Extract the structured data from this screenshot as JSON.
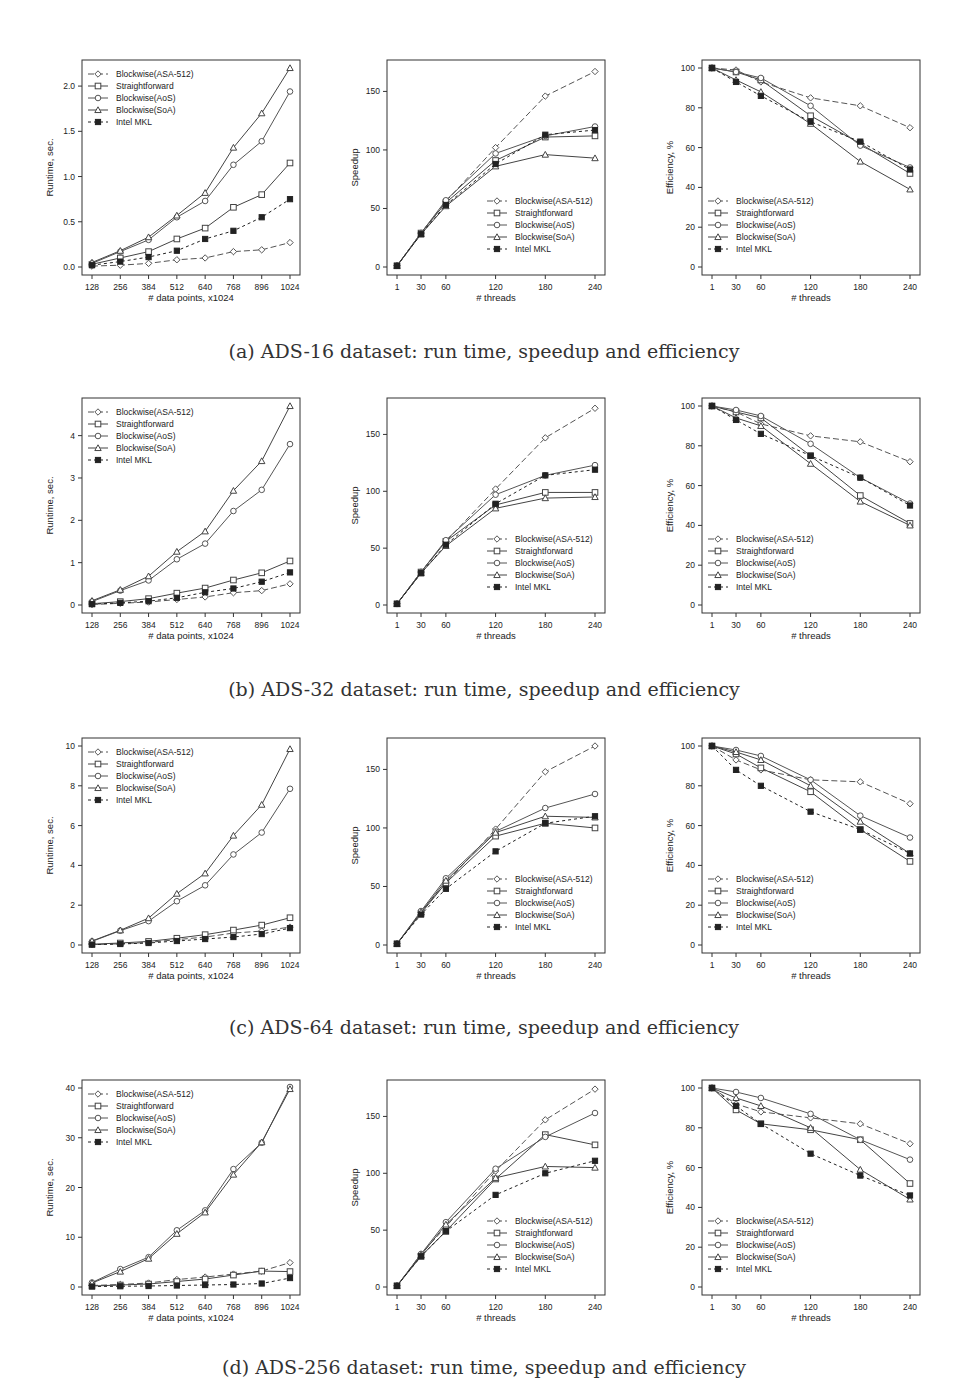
{
  "legend_labels": [
    "Blockwise(ASA-512)",
    "Straightforward",
    "Blockwise(AoS)",
    "Blockwise(SoA)",
    "Intel MKL"
  ],
  "series_style": [
    {
      "name": "Blockwise(ASA-512)",
      "marker": "diamond",
      "dash": "6,3"
    },
    {
      "name": "Straightforward",
      "marker": "square",
      "dash": ""
    },
    {
      "name": "Blockwise(AoS)",
      "marker": "circle",
      "dash": ""
    },
    {
      "name": "Blockwise(SoA)",
      "marker": "triangle",
      "dash": ""
    },
    {
      "name": "Intel MKL",
      "marker": "filled-square",
      "dash": "3,3"
    }
  ],
  "captions": [
    "(a) ADS-16 dataset: run time, speedup and efficiency",
    "(b) ADS-32 dataset: run time, speedup and efficiency",
    "(c) ADS-64 dataset: run time, speedup and efficiency",
    "(d) ADS-256 dataset: run time, speedup and efficiency"
  ],
  "chart_data": [
    {
      "id": "a-runtime",
      "type": "line",
      "title": "",
      "xlabel": "# data points, x1024",
      "ylabel": "Runtime, sec.",
      "x": [
        128,
        256,
        384,
        512,
        640,
        768,
        896,
        1024
      ],
      "ylim": [
        0,
        2.2
      ],
      "yticks": [
        0.0,
        0.5,
        1.0,
        1.5,
        2.0
      ],
      "ytick_labels": [
        "0.0",
        "0.5",
        "1.0",
        "1.5",
        "2.0"
      ],
      "legend": "topleft",
      "series": [
        {
          "name": "Blockwise(ASA-512)",
          "values": [
            0.01,
            0.02,
            0.04,
            0.08,
            0.1,
            0.17,
            0.19,
            0.27
          ]
        },
        {
          "name": "Straightforward",
          "values": [
            0.03,
            0.1,
            0.17,
            0.31,
            0.43,
            0.66,
            0.8,
            1.15
          ]
        },
        {
          "name": "Blockwise(AoS)",
          "values": [
            0.04,
            0.17,
            0.3,
            0.55,
            0.73,
            1.13,
            1.39,
            1.94
          ]
        },
        {
          "name": "Blockwise(SoA)",
          "values": [
            0.05,
            0.18,
            0.33,
            0.57,
            0.82,
            1.32,
            1.7,
            2.2
          ]
        },
        {
          "name": "Intel MKL",
          "values": [
            0.02,
            0.06,
            0.11,
            0.18,
            0.31,
            0.4,
            0.55,
            0.75
          ]
        }
      ]
    },
    {
      "id": "a-speedup",
      "type": "line",
      "xlabel": "# threads",
      "ylabel": "Speedup",
      "x": [
        1,
        30,
        60,
        120,
        180,
        240
      ],
      "ylim": [
        0,
        170
      ],
      "yticks": [
        0,
        50,
        100,
        150
      ],
      "ytick_labels": [
        "0",
        "50",
        "100",
        "150"
      ],
      "legend": "bottomright",
      "series": [
        {
          "name": "Blockwise(ASA-512)",
          "values": [
            1,
            29,
            56,
            102,
            146,
            167
          ]
        },
        {
          "name": "Straightforward",
          "values": [
            1,
            29,
            55,
            91,
            111,
            112
          ]
        },
        {
          "name": "Blockwise(AoS)",
          "values": [
            1,
            29,
            57,
            97,
            112,
            120
          ]
        },
        {
          "name": "Blockwise(SoA)",
          "values": [
            1,
            28,
            52,
            86,
            96,
            93
          ]
        },
        {
          "name": "Intel MKL",
          "values": [
            1,
            28,
            53,
            88,
            113,
            117
          ]
        }
      ]
    },
    {
      "id": "a-efficiency",
      "type": "line",
      "xlabel": "# threads",
      "ylabel": "Efficiency, %",
      "x": [
        1,
        30,
        60,
        120,
        180,
        240
      ],
      "ylim": [
        0,
        100
      ],
      "yticks": [
        0,
        20,
        40,
        60,
        80,
        100
      ],
      "ytick_labels": [
        "0",
        "20",
        "40",
        "60",
        "80",
        "100"
      ],
      "legend": "bottomleft",
      "series": [
        {
          "name": "Blockwise(ASA-512)",
          "values": [
            100,
            99,
            93,
            85,
            81,
            70
          ]
        },
        {
          "name": "Straightforward",
          "values": [
            100,
            98,
            94,
            76,
            62,
            47
          ]
        },
        {
          "name": "Blockwise(AoS)",
          "values": [
            100,
            98,
            95,
            81,
            61,
            50
          ]
        },
        {
          "name": "Blockwise(SoA)",
          "values": [
            100,
            94,
            88,
            72,
            53,
            39
          ]
        },
        {
          "name": "Intel MKL",
          "values": [
            100,
            93,
            86,
            73,
            63,
            49
          ]
        }
      ]
    },
    {
      "id": "b-runtime",
      "type": "line",
      "xlabel": "# data points, x1024",
      "ylabel": "Runtime, sec.",
      "x": [
        128,
        256,
        384,
        512,
        640,
        768,
        896,
        1024
      ],
      "ylim": [
        0,
        4.7
      ],
      "yticks": [
        0,
        1,
        2,
        3,
        4
      ],
      "ytick_labels": [
        "0",
        "1",
        "2",
        "3",
        "4"
      ],
      "legend": "topleft",
      "series": [
        {
          "name": "Blockwise(ASA-512)",
          "values": [
            0.01,
            0.04,
            0.07,
            0.13,
            0.19,
            0.29,
            0.34,
            0.5
          ]
        },
        {
          "name": "Straightforward",
          "values": [
            0.03,
            0.08,
            0.15,
            0.28,
            0.4,
            0.59,
            0.76,
            1.04
          ]
        },
        {
          "name": "Blockwise(AoS)",
          "values": [
            0.08,
            0.34,
            0.58,
            1.08,
            1.45,
            2.22,
            2.72,
            3.8
          ]
        },
        {
          "name": "Blockwise(SoA)",
          "values": [
            0.1,
            0.36,
            0.68,
            1.26,
            1.74,
            2.7,
            3.4,
            4.7
          ]
        },
        {
          "name": "Intel MKL",
          "values": [
            0.02,
            0.05,
            0.09,
            0.17,
            0.3,
            0.39,
            0.55,
            0.77
          ]
        }
      ]
    },
    {
      "id": "b-speedup",
      "type": "line",
      "xlabel": "# threads",
      "ylabel": "Speedup",
      "x": [
        1,
        30,
        60,
        120,
        180,
        240
      ],
      "ylim": [
        0,
        175
      ],
      "yticks": [
        0,
        50,
        100,
        150
      ],
      "ytick_labels": [
        "0",
        "50",
        "100",
        "150"
      ],
      "legend": "bottomright",
      "series": [
        {
          "name": "Blockwise(ASA-512)",
          "values": [
            1,
            29,
            56,
            102,
            147,
            173
          ]
        },
        {
          "name": "Straightforward",
          "values": [
            1,
            29,
            56,
            88,
            99,
            99
          ]
        },
        {
          "name": "Blockwise(AoS)",
          "values": [
            1,
            29,
            57,
            97,
            114,
            123
          ]
        },
        {
          "name": "Blockwise(SoA)",
          "values": [
            1,
            28,
            52,
            85,
            94,
            95
          ]
        },
        {
          "name": "Intel MKL",
          "values": [
            1,
            28,
            53,
            89,
            114,
            119
          ]
        }
      ]
    },
    {
      "id": "b-efficiency",
      "type": "line",
      "xlabel": "# threads",
      "ylabel": "Efficiency, %",
      "x": [
        1,
        30,
        60,
        120,
        180,
        240
      ],
      "ylim": [
        0,
        100
      ],
      "yticks": [
        0,
        20,
        40,
        60,
        80,
        100
      ],
      "ytick_labels": [
        "0",
        "20",
        "40",
        "60",
        "80",
        "100"
      ],
      "legend": "bottomleft",
      "series": [
        {
          "name": "Blockwise(ASA-512)",
          "values": [
            100,
            97,
            91,
            85,
            82,
            72
          ]
        },
        {
          "name": "Straightforward",
          "values": [
            100,
            97,
            94,
            75,
            55,
            41
          ]
        },
        {
          "name": "Blockwise(AoS)",
          "values": [
            100,
            98,
            95,
            81,
            64,
            51
          ]
        },
        {
          "name": "Blockwise(SoA)",
          "values": [
            100,
            94,
            90,
            71,
            52,
            40
          ]
        },
        {
          "name": "Intel MKL",
          "values": [
            100,
            93,
            86,
            75,
            64,
            50
          ]
        }
      ]
    },
    {
      "id": "c-runtime",
      "type": "line",
      "xlabel": "# data points, x1024",
      "ylabel": "Runtime, sec.",
      "x": [
        128,
        256,
        384,
        512,
        640,
        768,
        896,
        1024
      ],
      "ylim": [
        0,
        10
      ],
      "yticks": [
        0,
        2,
        4,
        6,
        8,
        10
      ],
      "ytick_labels": [
        "0",
        "2",
        "4",
        "6",
        "8",
        "10"
      ],
      "legend": "topleft",
      "series": [
        {
          "name": "Blockwise(ASA-512)",
          "values": [
            0.02,
            0.06,
            0.13,
            0.27,
            0.4,
            0.6,
            0.7,
            0.9
          ]
        },
        {
          "name": "Straightforward",
          "values": [
            0.04,
            0.1,
            0.18,
            0.34,
            0.52,
            0.75,
            1.0,
            1.37
          ]
        },
        {
          "name": "Blockwise(AoS)",
          "values": [
            0.18,
            0.72,
            1.2,
            2.2,
            3.0,
            4.55,
            5.65,
            7.85
          ]
        },
        {
          "name": "Blockwise(SoA)",
          "values": [
            0.2,
            0.74,
            1.35,
            2.58,
            3.6,
            5.5,
            7.05,
            9.85
          ]
        },
        {
          "name": "Intel MKL",
          "values": [
            0.02,
            0.05,
            0.1,
            0.2,
            0.3,
            0.4,
            0.55,
            0.85
          ]
        }
      ]
    },
    {
      "id": "c-speedup",
      "type": "line",
      "xlabel": "# threads",
      "ylabel": "Speedup",
      "x": [
        1,
        30,
        60,
        120,
        180,
        240
      ],
      "ylim": [
        0,
        170
      ],
      "yticks": [
        0,
        50,
        100,
        150
      ],
      "ytick_labels": [
        "0",
        "50",
        "100",
        "150"
      ],
      "legend": "bottomright",
      "series": [
        {
          "name": "Blockwise(ASA-512)",
          "values": [
            1,
            28,
            53,
            99,
            148,
            170
          ]
        },
        {
          "name": "Straightforward",
          "values": [
            1,
            27,
            53,
            93,
            104,
            100
          ]
        },
        {
          "name": "Blockwise(AoS)",
          "values": [
            1,
            29,
            57,
            97,
            117,
            129
          ]
        },
        {
          "name": "Blockwise(SoA)",
          "values": [
            1,
            28,
            55,
            96,
            110,
            109
          ]
        },
        {
          "name": "Intel MKL",
          "values": [
            1,
            26,
            48,
            80,
            104,
            110
          ]
        }
      ]
    },
    {
      "id": "c-efficiency",
      "type": "line",
      "xlabel": "# threads",
      "ylabel": "Efficiency, %",
      "x": [
        1,
        30,
        60,
        120,
        180,
        240
      ],
      "ylim": [
        0,
        100
      ],
      "yticks": [
        0,
        20,
        40,
        60,
        80,
        100
      ],
      "ytick_labels": [
        "0",
        "20",
        "40",
        "60",
        "80",
        "100"
      ],
      "legend": "bottomleft",
      "series": [
        {
          "name": "Blockwise(ASA-512)",
          "values": [
            100,
            93,
            88,
            83,
            82,
            71
          ]
        },
        {
          "name": "Straightforward",
          "values": [
            100,
            96,
            89,
            77,
            58,
            42
          ]
        },
        {
          "name": "Blockwise(AoS)",
          "values": [
            100,
            98,
            95,
            83,
            65,
            54
          ]
        },
        {
          "name": "Blockwise(SoA)",
          "values": [
            100,
            97,
            93,
            80,
            62,
            46
          ]
        },
        {
          "name": "Intel MKL",
          "values": [
            100,
            88,
            80,
            67,
            58,
            46
          ]
        }
      ]
    },
    {
      "id": "d-runtime",
      "type": "line",
      "xlabel": "# data points, x1024",
      "ylabel": "Runtime, sec.",
      "x": [
        128,
        256,
        384,
        512,
        640,
        768,
        896,
        1024
      ],
      "ylim": [
        0,
        40
      ],
      "yticks": [
        0,
        10,
        20,
        30,
        40
      ],
      "ytick_labels": [
        "0",
        "10",
        "20",
        "30",
        "40"
      ],
      "legend": "topleft",
      "series": [
        {
          "name": "Blockwise(ASA-512)",
          "values": [
            0.3,
            0.5,
            0.8,
            1.5,
            2.0,
            2.6,
            3.2,
            4.9
          ]
        },
        {
          "name": "Straightforward",
          "values": [
            0.2,
            0.4,
            0.6,
            1.1,
            1.6,
            2.4,
            3.2,
            3.1
          ]
        },
        {
          "name": "Blockwise(AoS)",
          "values": [
            0.9,
            3.6,
            6.0,
            11.4,
            15.4,
            23.7,
            29.0,
            40.2
          ]
        },
        {
          "name": "Blockwise(SoA)",
          "values": [
            0.8,
            3.1,
            5.7,
            10.7,
            15.0,
            22.6,
            29.1,
            39.8
          ]
        },
        {
          "name": "Intel MKL",
          "values": [
            0.1,
            0.15,
            0.2,
            0.3,
            0.4,
            0.5,
            0.7,
            1.8
          ]
        }
      ]
    },
    {
      "id": "d-speedup",
      "type": "line",
      "xlabel": "# threads",
      "ylabel": "Speedup",
      "x": [
        1,
        30,
        60,
        120,
        180,
        240
      ],
      "ylim": [
        0,
        175
      ],
      "yticks": [
        0,
        50,
        100,
        150
      ],
      "ytick_labels": [
        "0",
        "50",
        "100",
        "150"
      ],
      "legend": "bottomright",
      "series": [
        {
          "name": "Blockwise(ASA-512)",
          "values": [
            1,
            29,
            53,
            102,
            147,
            174
          ]
        },
        {
          "name": "Straightforward",
          "values": [
            1,
            27,
            49,
            95,
            134,
            125
          ]
        },
        {
          "name": "Blockwise(AoS)",
          "values": [
            1,
            29,
            57,
            104,
            132,
            153
          ]
        },
        {
          "name": "Blockwise(SoA)",
          "values": [
            1,
            28,
            55,
            96,
            106,
            105
          ]
        },
        {
          "name": "Intel MKL",
          "values": [
            1,
            27,
            49,
            81,
            100,
            111
          ]
        }
      ]
    },
    {
      "id": "d-efficiency",
      "type": "line",
      "xlabel": "# threads",
      "ylabel": "Efficiency, %",
      "x": [
        1,
        30,
        60,
        120,
        180,
        240
      ],
      "ylim": [
        0,
        100
      ],
      "yticks": [
        0,
        20,
        40,
        60,
        80,
        100
      ],
      "ytick_labels": [
        "0",
        "20",
        "40",
        "60",
        "80",
        "100"
      ],
      "legend": "bottomleft",
      "series": [
        {
          "name": "Blockwise(ASA-512)",
          "values": [
            100,
            92,
            88,
            85,
            82,
            72
          ]
        },
        {
          "name": "Straightforward",
          "values": [
            100,
            89,
            82,
            79,
            74,
            52
          ]
        },
        {
          "name": "Blockwise(AoS)",
          "values": [
            100,
            98,
            95,
            87,
            74,
            64
          ]
        },
        {
          "name": "Blockwise(SoA)",
          "values": [
            100,
            95,
            91,
            80,
            59,
            44
          ]
        },
        {
          "name": "Intel MKL",
          "values": [
            100,
            91,
            82,
            67,
            56,
            46
          ]
        }
      ]
    }
  ]
}
